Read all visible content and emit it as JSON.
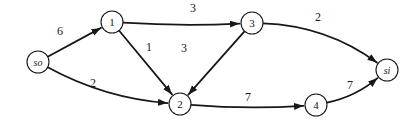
{
  "diagram": {
    "width": 417,
    "height": 128,
    "background": "#ffffff",
    "stroke_color": "#171717",
    "node_radius": 11,
    "node_stroke_width": 1.1,
    "edge_stroke_width": 1.8,
    "nodes": [
      {
        "id": "so",
        "label": "so",
        "x": 38,
        "y": 62,
        "italic": true
      },
      {
        "id": "1",
        "label": "1",
        "x": 112,
        "y": 22,
        "italic": false
      },
      {
        "id": "2",
        "label": "2",
        "x": 180,
        "y": 104,
        "italic": false
      },
      {
        "id": "3",
        "label": "3",
        "x": 252,
        "y": 23,
        "italic": false
      },
      {
        "id": "4",
        "label": "4",
        "x": 316,
        "y": 105,
        "italic": false
      },
      {
        "id": "si",
        "label": "si",
        "x": 387,
        "y": 70,
        "italic": true
      }
    ],
    "edges": [
      {
        "from": "so",
        "to": "1",
        "label": "6",
        "label_x": 60,
        "label_y": 31,
        "curve": 0
      },
      {
        "from": "so",
        "to": "2",
        "label": "2",
        "label_x": 93,
        "label_y": 83,
        "curve": 16
      },
      {
        "from": "1",
        "to": "3",
        "label": "3",
        "label_x": 193,
        "label_y": 8,
        "curve": 4
      },
      {
        "from": "1",
        "to": "2",
        "label": "1",
        "label_x": 149,
        "label_y": 47,
        "curve": 0
      },
      {
        "from": "3",
        "to": "2",
        "label": "3",
        "label_x": 184,
        "label_y": 48,
        "curve": 0
      },
      {
        "from": "3",
        "to": "si",
        "label": "2",
        "label_x": 318,
        "label_y": 17,
        "curve": -22
      },
      {
        "from": "2",
        "to": "4",
        "label": "7",
        "label_x": 248,
        "label_y": 97,
        "curve": 5
      },
      {
        "from": "4",
        "to": "si",
        "label": "7",
        "label_x": 350,
        "label_y": 85,
        "curve": 10
      }
    ]
  }
}
